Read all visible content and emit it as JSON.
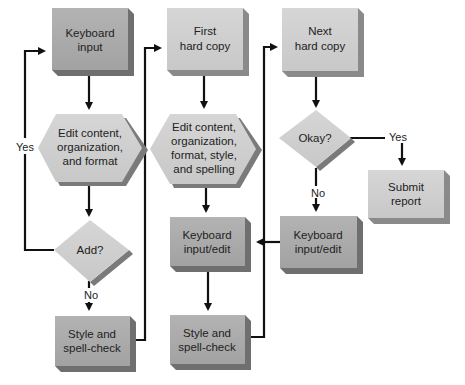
{
  "colors": {
    "dark_box": "#a8a8a8",
    "light_box": "#cfcfcf",
    "shadow": "#6f6f6f",
    "line": "#111111",
    "text": "#222222"
  },
  "nodes": {
    "keyboard_input": {
      "line1": "Keyboard",
      "line2": "input"
    },
    "edit1": {
      "line1": "Edit content,",
      "line2": "organization,",
      "line3": "and format"
    },
    "add": {
      "line1": "Add?"
    },
    "style1": {
      "line1": "Style and",
      "line2": "spell-check"
    },
    "first_copy": {
      "line1": "First",
      "line2": "hard copy"
    },
    "edit2": {
      "line1": "Edit content,",
      "line2": "organization,",
      "line3": "format, style,",
      "line4": "and spelling"
    },
    "kb_edit2": {
      "line1": "Keyboard",
      "line2": "input/edit"
    },
    "style2": {
      "line1": "Style and",
      "line2": "spell-check"
    },
    "next_copy": {
      "line1": "Next",
      "line2": "hard copy"
    },
    "okay": {
      "line1": "Okay?"
    },
    "submit": {
      "line1": "Submit",
      "line2": "report"
    },
    "kb_edit3": {
      "line1": "Keyboard",
      "line2": "input/edit"
    }
  },
  "edge_labels": {
    "add_yes": "Yes",
    "add_no": "No",
    "okay_yes": "Yes",
    "okay_no": "No"
  }
}
